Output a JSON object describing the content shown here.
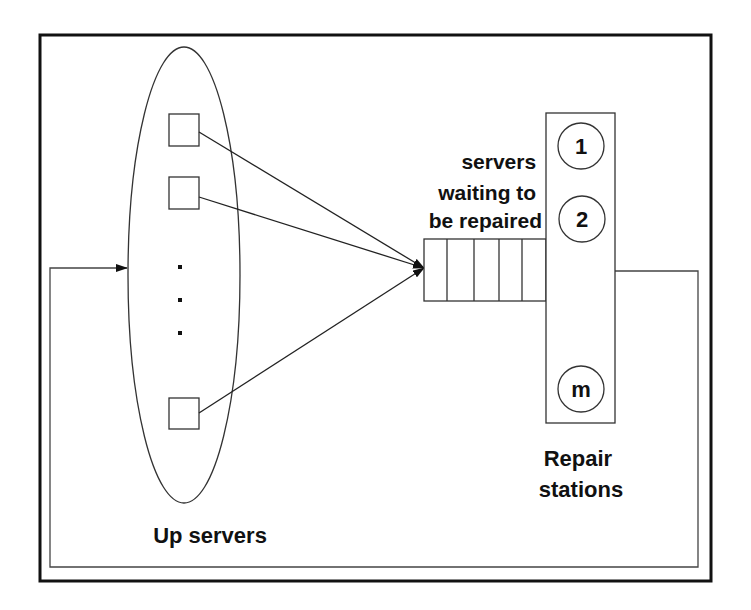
{
  "diagram": {
    "up_servers": {
      "label": "Up servers",
      "ellipsis": "..."
    },
    "queue": {
      "label_lines": [
        "servers",
        "waiting to",
        "be repaired"
      ],
      "slots": 5
    },
    "repair_stations": {
      "label_lines": [
        "Repair",
        "stations"
      ],
      "stations": [
        "1",
        "2",
        "m"
      ]
    },
    "colors": {
      "stroke": "#222222",
      "background": "#ffffff"
    }
  }
}
